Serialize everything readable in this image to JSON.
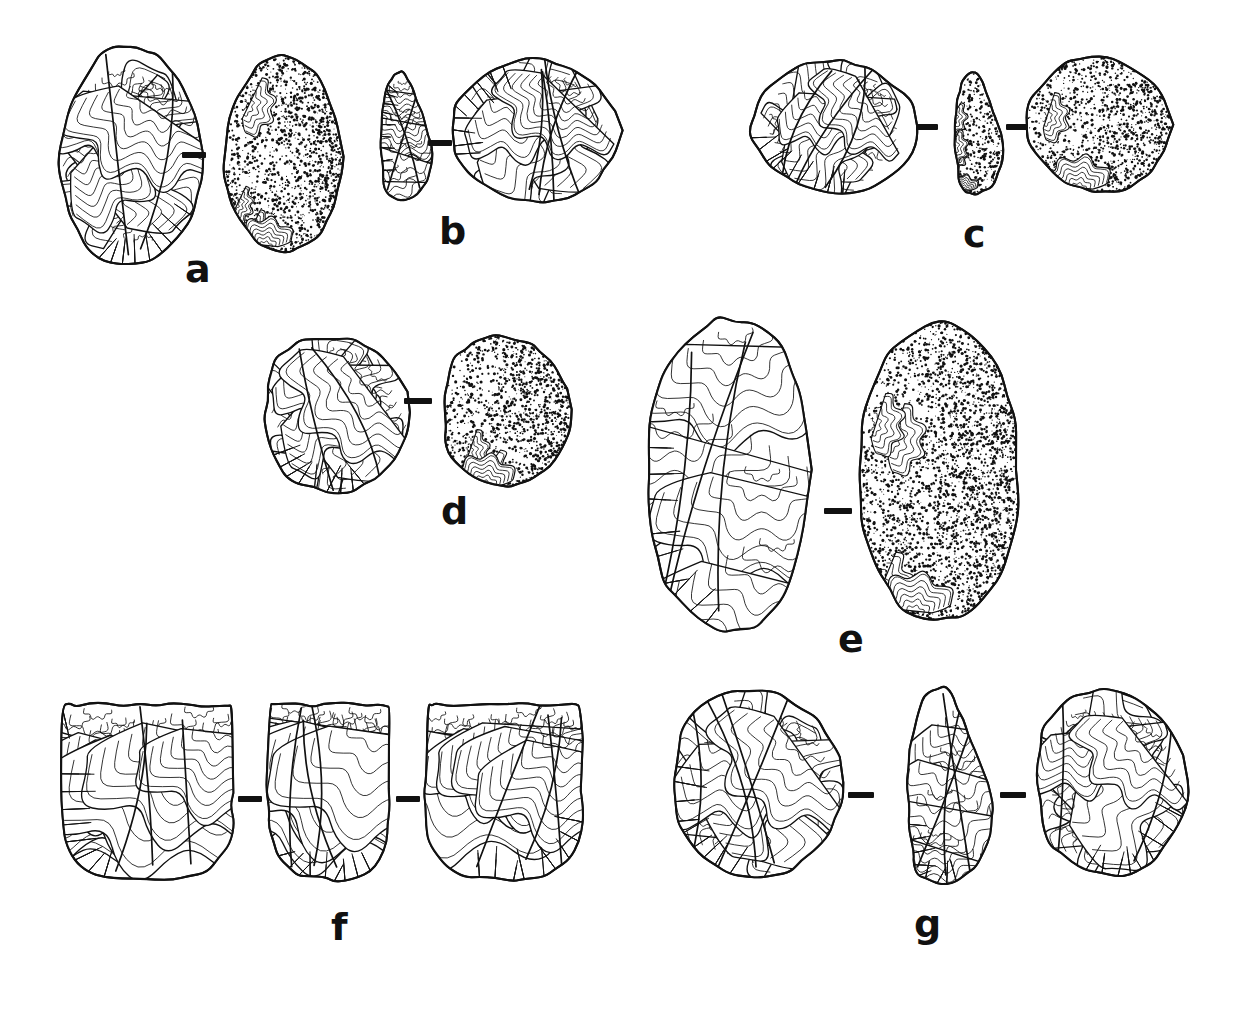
{
  "figure": {
    "kind": "archaeological-lithic-plate",
    "background_color": "#ffffff",
    "ink_color": "#111111",
    "label_color": "#111111"
  },
  "specimens": [
    {
      "id": "a",
      "label": "a",
      "label_x": 185,
      "label_y": 250,
      "view_count": 2,
      "views": [
        {
          "name": "dorsal-view",
          "shape": "ovate-biface",
          "texture": "flake-scar-ripples",
          "x": 58,
          "y": 45,
          "w": 145,
          "h": 222
        },
        {
          "name": "ventral-view",
          "shape": "ovate-biface",
          "texture": "stippled-cortex",
          "x": 222,
          "y": 55,
          "w": 122,
          "h": 198
        }
      ],
      "connectors": [
        {
          "x": 182,
          "y": 152,
          "w": 24,
          "h": 6
        }
      ]
    },
    {
      "id": "b",
      "label": "b",
      "label_x": 439,
      "label_y": 212,
      "view_count": 2,
      "views": [
        {
          "name": "profile-view",
          "shape": "wedge-section",
          "texture": "flake-scar-ripples",
          "x": 365,
          "y": 72,
          "w": 70,
          "h": 128
        },
        {
          "name": "dorsal-view",
          "shape": "discoid-core",
          "texture": "flake-scar-ripples",
          "x": 452,
          "y": 57,
          "w": 166,
          "h": 148
        }
      ],
      "connectors": [
        {
          "x": 428,
          "y": 140,
          "w": 24,
          "h": 6
        }
      ]
    },
    {
      "id": "c",
      "label": "c",
      "label_x": 963,
      "label_y": 215,
      "view_count": 3,
      "views": [
        {
          "name": "dorsal-view",
          "shape": "discoid-core",
          "texture": "flake-scar-ripples",
          "x": 752,
          "y": 58,
          "w": 164,
          "h": 138
        },
        {
          "name": "profile-view",
          "shape": "wedge-section",
          "texture": "stippled-cortex",
          "x": 940,
          "y": 72,
          "w": 66,
          "h": 122
        },
        {
          "name": "ventral-view",
          "shape": "discoid-core",
          "texture": "stippled-cortex",
          "x": 1028,
          "y": 55,
          "w": 142,
          "h": 140
        }
      ],
      "connectors": [
        {
          "x": 916,
          "y": 124,
          "w": 22,
          "h": 6
        },
        {
          "x": 1006,
          "y": 124,
          "w": 22,
          "h": 6
        }
      ]
    },
    {
      "id": "d",
      "label": "d",
      "label_x": 441,
      "label_y": 492,
      "view_count": 2,
      "views": [
        {
          "name": "dorsal-view",
          "shape": "levallois-core",
          "texture": "flake-scar-ripples",
          "x": 258,
          "y": 330,
          "w": 152,
          "h": 168
        },
        {
          "name": "ventral-view",
          "shape": "levallois-core",
          "texture": "stippled-cortex",
          "x": 438,
          "y": 330,
          "w": 132,
          "h": 162
        }
      ],
      "connectors": [
        {
          "x": 404,
          "y": 398,
          "w": 28,
          "h": 6
        }
      ]
    },
    {
      "id": "e",
      "label": "e",
      "label_x": 838,
      "label_y": 620,
      "view_count": 2,
      "views": [
        {
          "name": "dorsal-view",
          "shape": "elongate-flake",
          "texture": "flake-scar-ripples",
          "x": 643,
          "y": 318,
          "w": 172,
          "h": 312
        },
        {
          "name": "ventral-view",
          "shape": "elongate-flake",
          "texture": "stippled-cortex",
          "x": 855,
          "y": 322,
          "w": 168,
          "h": 300
        }
      ],
      "connectors": [
        {
          "x": 824,
          "y": 508,
          "w": 28,
          "h": 6
        }
      ]
    },
    {
      "id": "f",
      "label": "f",
      "label_x": 331,
      "label_y": 908,
      "view_count": 3,
      "views": [
        {
          "name": "dorsal-view",
          "shape": "prismatic-core",
          "texture": "flake-scar-ripples",
          "x": 62,
          "y": 702,
          "w": 172,
          "h": 178
        },
        {
          "name": "profile-view",
          "shape": "prismatic-core",
          "texture": "flake-scar-ripples",
          "x": 268,
          "y": 702,
          "w": 122,
          "h": 178
        },
        {
          "name": "ventral-view",
          "shape": "prismatic-core",
          "texture": "flake-scar-ripples",
          "x": 424,
          "y": 702,
          "w": 160,
          "h": 178
        }
      ],
      "connectors": [
        {
          "x": 238,
          "y": 796,
          "w": 24,
          "h": 6
        },
        {
          "x": 396,
          "y": 796,
          "w": 24,
          "h": 6
        }
      ]
    },
    {
      "id": "g",
      "label": "g",
      "label_x": 914,
      "label_y": 905,
      "view_count": 3,
      "views": [
        {
          "name": "dorsal-view",
          "shape": "levallois-core",
          "texture": "flake-scar-ripples",
          "x": 668,
          "y": 682,
          "w": 176,
          "h": 202
        },
        {
          "name": "profile-view",
          "shape": "wedge-section",
          "texture": "flake-scar-ripples",
          "x": 882,
          "y": 688,
          "w": 116,
          "h": 196
        },
        {
          "name": "ventral-view",
          "shape": "levallois-core",
          "texture": "flake-scar-ripples",
          "x": 1030,
          "y": 682,
          "w": 158,
          "h": 200
        }
      ],
      "connectors": [
        {
          "x": 848,
          "y": 792,
          "w": 26,
          "h": 6
        },
        {
          "x": 1000,
          "y": 792,
          "w": 26,
          "h": 6
        }
      ]
    }
  ],
  "labels": {
    "a": "a",
    "b": "b",
    "c": "c",
    "d": "d",
    "e": "e",
    "f": "f",
    "g": "g"
  },
  "label_font_size_px": 38
}
